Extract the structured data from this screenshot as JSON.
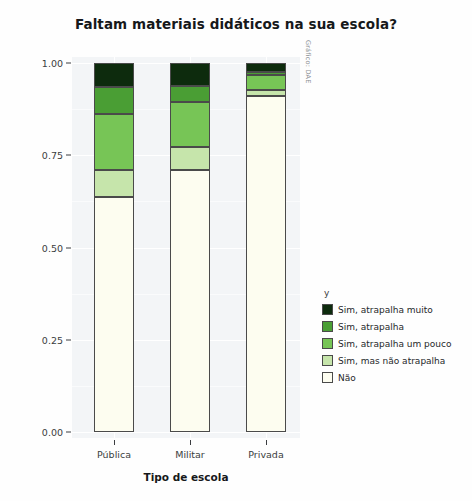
{
  "chart_data": {
    "type": "bar",
    "subtype": "stacked-proportional",
    "title": "Faltam materiais didáticos na sua escola?",
    "xlabel": "Tipo de escola",
    "ylabel": "População",
    "categories": [
      "Pública",
      "Militar",
      "Privada"
    ],
    "ylim": [
      0.0,
      1.0
    ],
    "ytick_labels": [
      "0.00",
      "0.25",
      "0.50",
      "0.75",
      "1.00"
    ],
    "ytick_values": [
      0.0,
      0.25,
      0.5,
      0.75,
      1.0
    ],
    "grid": true,
    "legend_title": "y",
    "legend_position": "right",
    "credit": "Gráfico: DAE",
    "series": [
      {
        "name": "Não",
        "color": "#fdfdf0",
        "values": [
          0.637,
          0.71,
          0.911
        ]
      },
      {
        "name": "Sim, mas não atrapalha",
        "color": "#c6e5ab",
        "values": [
          0.073,
          0.062,
          0.016
        ]
      },
      {
        "name": "Sim, atrapalha um pouco",
        "color": "#77c556",
        "values": [
          0.152,
          0.122,
          0.04
        ]
      },
      {
        "name": "Sim, atrapalha",
        "color": "#4a9e34",
        "values": [
          0.073,
          0.043,
          0.009
        ]
      },
      {
        "name": "Sim, atrapalha muito",
        "color": "#0d2b0d",
        "values": [
          0.065,
          0.063,
          0.024
        ]
      }
    ],
    "legend_entries": [
      {
        "label": "Sim, atrapalha muito",
        "color": "#0d2b0d"
      },
      {
        "label": "Sim, atrapalha",
        "color": "#4a9e34"
      },
      {
        "label": "Sim, atrapalha um pouco",
        "color": "#77c556"
      },
      {
        "label": "Sim, mas não atrapalha",
        "color": "#c6e5ab"
      },
      {
        "label": "Não",
        "color": "#fdfdf0"
      }
    ]
  }
}
